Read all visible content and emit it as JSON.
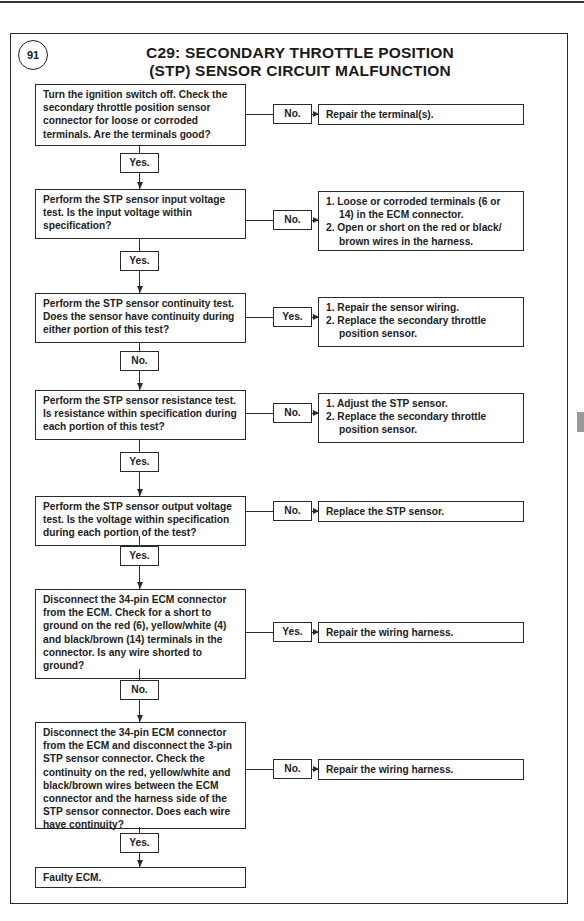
{
  "header": {
    "page_number": "91",
    "title_line1": "C29: SECONDARY THROTTLE POSITION",
    "title_line2": "(STP) SENSOR CIRCUIT MALFUNCTION"
  },
  "steps": [
    {
      "question": "Turn the ignition switch off. Check the secondary throttle position sensor connector for loose or corroded terminals. Are the terminals good?",
      "side_label": "No.",
      "side_result": [
        "Repair the terminal(s)."
      ],
      "down_label": "Yes."
    },
    {
      "question": "Perform the STP sensor input voltage test. Is the input voltage within specification?",
      "side_label": "No.",
      "side_result": [
        "1. Loose or corroded terminals (6 or 14) in the ECM connector.",
        "2. Open or short on the red or black/ brown wires in the harness."
      ],
      "down_label": "Yes."
    },
    {
      "question": "Perform the STP sensor continuity test. Does the sensor have continuity during either portion of this test?",
      "side_label": "Yes.",
      "side_result": [
        "1. Repair the sensor wiring.",
        "2. Replace the secondary throttle position sensor."
      ],
      "down_label": "No."
    },
    {
      "question": "Perform the STP sensor resistance test. Is resistance within specification during each portion of this test?",
      "side_label": "No.",
      "side_result": [
        "1. Adjust the STP sensor.",
        "2. Replace the secondary throttle position sensor."
      ],
      "down_label": "Yes."
    },
    {
      "question": "Perform the STP sensor output voltage test. Is the voltage within specification during each portion of the test?",
      "side_label": "No.",
      "side_result": [
        "Replace the STP sensor."
      ],
      "down_label": "Yes."
    },
    {
      "question": "Disconnect the 34-pin ECM connector from the ECM. Check for a short to ground on the red (6), yellow/white (4) and black/brown (14) terminals in the connector. Is any wire shorted to ground?",
      "side_label": "Yes.",
      "side_result": [
        "Repair the wiring harness."
      ],
      "down_label": "No."
    },
    {
      "question": "Disconnect the 34-pin ECM connector from the ECM and disconnect the 3-pin STP sensor connector. Check the continuity on the red, yellow/white and black/brown wires between the ECM connector and the harness side of the STP sensor connector. Does each wire have continuity?",
      "side_label": "No.",
      "side_result": [
        "Repair the wiring harness."
      ],
      "down_label": "Yes."
    }
  ],
  "final": {
    "result": "Faulty ECM."
  },
  "colors": {
    "line": "#2a2a2a",
    "tab": "#9a9a9a",
    "background": "#ffffff"
  }
}
